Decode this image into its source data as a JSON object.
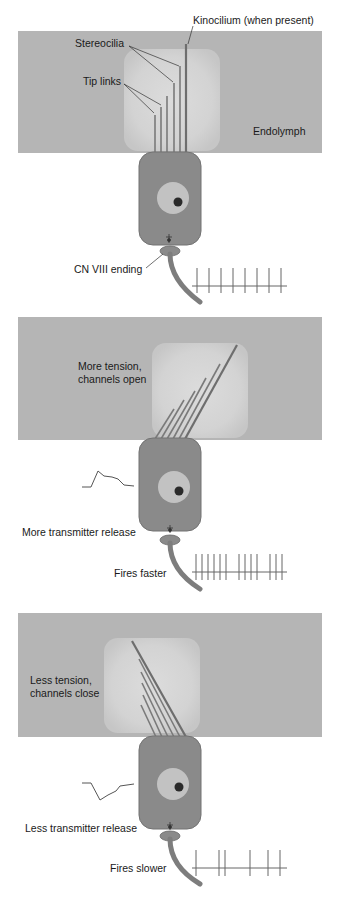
{
  "colors": {
    "endolymph_bg": "#b5b5b5",
    "glow": "#d6d6d6",
    "cell_body": "#8a8a8a",
    "cell_outline": "#6f6f6f",
    "nucleus_ring": "#c2c2c2",
    "nucleus_core": "#2a2a2a",
    "stereocilia": "#7a7a7a",
    "nerve": "#8a8a8a",
    "trace": "#555555"
  },
  "panel1": {
    "kinocilium_label": "Kinocilium (when present)",
    "stereocilia_label": "Stereocilia",
    "tip_links_label": "Tip links",
    "endolymph_label": "Endolymph",
    "nerve_label": "CN VIII ending",
    "spike_count": 8
  },
  "panel2": {
    "state_label_line1": "More tension,",
    "state_label_line2": "channels open",
    "release_label": "More transmitter release",
    "firing_label": "Fires faster",
    "spike_count": 12
  },
  "panel3": {
    "state_label_line1": "Less tension,",
    "state_label_line2": "channels close",
    "release_label": "Less transmitter release",
    "firing_label": "Fires slower",
    "spike_count": 6
  }
}
